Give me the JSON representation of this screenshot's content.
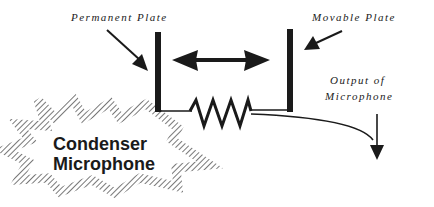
{
  "diagram": {
    "labels": {
      "permanent_plate": "Permanent   Plate",
      "movable_plate": "Movable   Plate",
      "output_line1": "Output  of",
      "output_line2": "Microphone"
    },
    "title": {
      "line1": "Condenser",
      "line2": "Microphone"
    },
    "colors": {
      "ink": "#1a1a1a",
      "hatch": "#555555",
      "background": "#ffffff"
    }
  }
}
